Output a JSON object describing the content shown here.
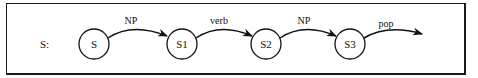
{
  "diagram": {
    "type": "transition-network",
    "row_label": "S:",
    "states": [
      {
        "id": "S",
        "label": "S",
        "cx": 94,
        "cy": 44
      },
      {
        "id": "S1",
        "label": "S1",
        "cx": 182,
        "cy": 44
      },
      {
        "id": "S2",
        "label": "S2",
        "cx": 266,
        "cy": 44
      },
      {
        "id": "S3",
        "label": "S3",
        "cx": 350,
        "cy": 44
      }
    ],
    "arcs": [
      {
        "from": "S",
        "to": "S1",
        "label": "NP"
      },
      {
        "from": "S1",
        "to": "S2",
        "label": "verb"
      },
      {
        "from": "S2",
        "to": "S3",
        "label": "NP"
      },
      {
        "from": "S3",
        "to": null,
        "label": "pop"
      }
    ],
    "colors": {
      "stroke": "#111111",
      "background": "#ffffff",
      "border": "#1a1a1a"
    }
  }
}
